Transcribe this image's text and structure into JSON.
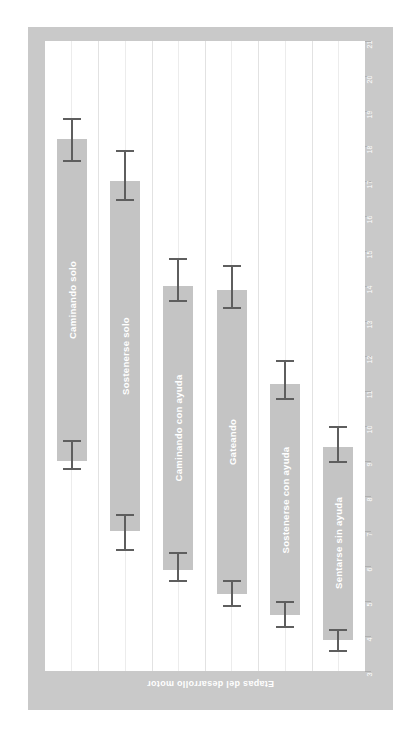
{
  "chart_title": "Periodos de los logros",
  "axis": {
    "value_axis_title": "Edad en meses",
    "category_axis_title": "Etapas del desarrollo motor",
    "ticks": [
      21,
      20,
      19,
      18,
      17,
      16,
      15,
      14,
      13,
      12,
      11,
      10,
      9,
      8,
      7,
      6,
      5,
      4,
      3
    ]
  },
  "colors": {
    "frame": "#c9c9c9",
    "bar": "#c4c4c4",
    "error": "#5e5e5e",
    "grid": "#e2e2e2",
    "title_text": "#8d8d8d",
    "axis_text": "#ffffff"
  },
  "chart_data": {
    "type": "bar",
    "title": "Periodos de los logros",
    "xlabel": "Etapas del desarrollo motor",
    "ylabel": "Edad en meses",
    "ylim": [
      3,
      21
    ],
    "grid": true,
    "orientation": "vertical-range-bars",
    "categories": [
      "Caminando solo",
      "Sostenerse solo",
      "Caminando con ayuda",
      "Gateando",
      "Sostenerse con ayuda",
      "Sentarse sin ayuda"
    ],
    "values": [
      {
        "label": "Caminando solo",
        "low": 9.0,
        "high": 18.2,
        "err_high_top": 18.8,
        "err_high_bottom": 17.6,
        "err_low_top": 9.6,
        "err_low_bottom": 8.8
      },
      {
        "label": "Sostenerse solo",
        "low": 7.0,
        "high": 17.0,
        "err_high_top": 17.9,
        "err_high_bottom": 16.5,
        "err_low_top": 7.5,
        "err_low_bottom": 6.5
      },
      {
        "label": "Caminando con ayuda",
        "low": 5.9,
        "high": 14.0,
        "err_high_top": 14.8,
        "err_high_bottom": 13.6,
        "err_low_top": 6.4,
        "err_low_bottom": 5.6
      },
      {
        "label": "Gateando",
        "low": 5.2,
        "high": 13.9,
        "err_high_top": 14.6,
        "err_high_bottom": 13.4,
        "err_low_top": 5.6,
        "err_low_bottom": 4.9
      },
      {
        "label": "Sostenerse con ayuda",
        "low": 4.6,
        "high": 11.2,
        "err_high_top": 11.9,
        "err_high_bottom": 10.8,
        "err_low_top": 5.0,
        "err_low_bottom": 4.3
      },
      {
        "label": "Sentarse sin ayuda",
        "low": 3.9,
        "high": 9.4,
        "err_high_top": 10.0,
        "err_high_bottom": 9.0,
        "err_low_top": 4.2,
        "err_low_bottom": 3.6
      }
    ]
  }
}
